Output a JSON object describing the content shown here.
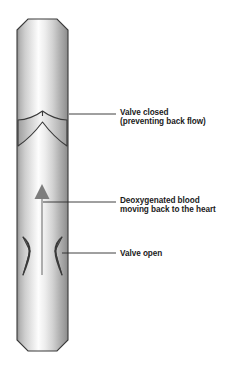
{
  "figure": {
    "background_color": "#ffffff",
    "outline_color": "#3a3a3a",
    "arrow_color": "#7d7d7d",
    "text_color": "#1b1b1b"
  },
  "labels": [
    {
      "id": "valve-closed",
      "line1": "Valve closed",
      "line2": "(preventing back flow)",
      "text_x": 120,
      "line1_y": 115,
      "line2_y": 124,
      "leader_x1": 69,
      "leader_x2": 116,
      "leader_y": 114
    },
    {
      "id": "deoxygenated-blood",
      "line1": "Deoxygenated blood",
      "line2": "moving back to the heart",
      "text_x": 120,
      "line1_y": 203,
      "line2_y": 212,
      "leader_x1": 43,
      "leader_x2": 116,
      "leader_y": 202
    },
    {
      "id": "valve-open",
      "line1": "Valve open",
      "line2": "",
      "text_x": 120,
      "line1_y": 256,
      "line2_y": 0,
      "leader_x1": 62,
      "leader_x2": 116,
      "leader_y": 253
    }
  ],
  "vessel": {
    "left_edge": 17,
    "right_edge": 68,
    "top": 19,
    "bottom": 351,
    "bevel": 11
  },
  "flow_arrow": {
    "direction": "up",
    "meaning": "blood moving back to the heart",
    "tip_y": 185,
    "base_y": 275,
    "x": 42
  },
  "valves": [
    {
      "id": "closed-valve",
      "state": "closed",
      "y": 112
    },
    {
      "id": "open-valve",
      "state": "open",
      "y": 245
    }
  ]
}
